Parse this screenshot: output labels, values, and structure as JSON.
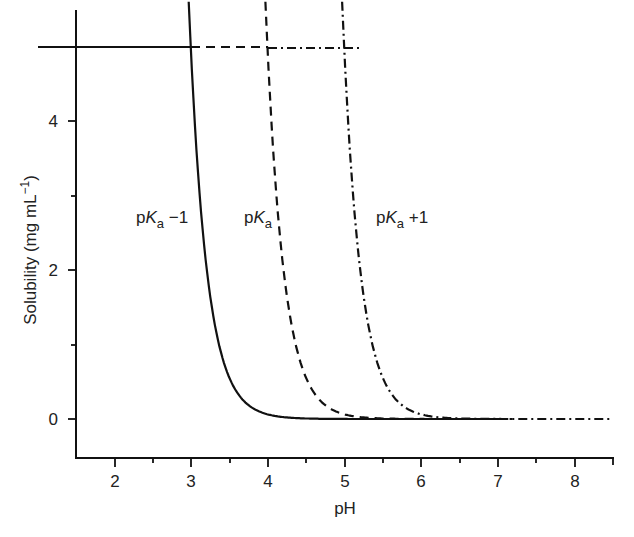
{
  "chart_data": {
    "type": "line",
    "title": "",
    "xlabel": "pH",
    "ylabel": "Solubility (mg mL⁻¹)",
    "xlim": [
      1.5,
      8.5
    ],
    "ylim": [
      -1.3,
      5.6
    ],
    "xticks": [
      2,
      3,
      4,
      5,
      6,
      7,
      8
    ],
    "yticks": [
      0,
      2,
      4
    ],
    "grid": false,
    "legend": "inline labels",
    "solubility_limit": 5,
    "series": [
      {
        "name": "pKa −1",
        "style": "solid",
        "x": [
          3.0,
          3.2,
          3.5,
          4.0,
          4.5,
          5.0,
          6.0,
          7.0
        ],
        "y": [
          5.0,
          3.2,
          1.6,
          0.5,
          0.16,
          0.05,
          0.005,
          0.0
        ]
      },
      {
        "name": "pKa",
        "style": "dashed",
        "x": [
          4.0,
          4.2,
          4.5,
          5.0,
          5.5,
          6.0,
          7.0,
          8.0
        ],
        "y": [
          5.0,
          3.2,
          1.6,
          0.5,
          0.16,
          0.05,
          0.005,
          0.0
        ]
      },
      {
        "name": "pKa +1",
        "style": "dash-dot",
        "x": [
          5.0,
          5.2,
          5.5,
          6.0,
          6.5,
          7.0,
          8.0,
          8.5
        ],
        "y": [
          5.0,
          3.2,
          1.6,
          0.5,
          0.16,
          0.05,
          0.005,
          0.0
        ]
      }
    ],
    "annotations": [
      "pKa −1",
      "pKa",
      "pKa +1"
    ]
  },
  "labels": {
    "x_title": "pH",
    "y_title": "Solubility (mg mL",
    "y_title_sup": "−1",
    "y_title_end": ")",
    "curve1_pre": "p",
    "curve1_k": "K",
    "curve1_sub": "a",
    "curve1_post": " −1",
    "curve2_pre": "p",
    "curve2_k": "K",
    "curve2_sub": "a",
    "curve3_pre": "p",
    "curve3_k": "K",
    "curve3_sub": "a",
    "curve3_post": " +1",
    "xt": [
      "2",
      "3",
      "4",
      "5",
      "6",
      "7",
      "8"
    ],
    "yt": [
      "0",
      "2",
      "4"
    ]
  }
}
